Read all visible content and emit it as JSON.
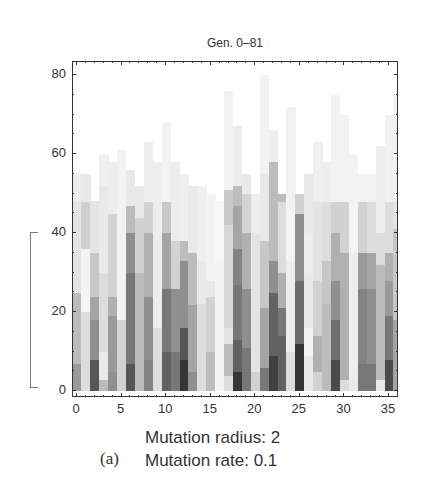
{
  "chart_data": {
    "type": "heatmap",
    "title": "Gen. 0–81",
    "xlabel": "",
    "ylabel": "",
    "xlim": [
      0,
      36
    ],
    "ylim": [
      0,
      82
    ],
    "x_ticks": [
      0,
      5,
      10,
      15,
      20,
      25,
      30,
      35
    ],
    "y_ticks": [
      0,
      20,
      40,
      60,
      80
    ],
    "grid": false,
    "legend": null,
    "columns": [
      {
        "x": 0,
        "segments": [
          [
            0,
            7,
            0.45
          ],
          [
            7,
            25,
            0.3
          ],
          [
            25,
            48,
            0.12
          ],
          [
            48,
            55,
            0.08
          ]
        ]
      },
      {
        "x": 1,
        "segments": [
          [
            0,
            20,
            0.15
          ],
          [
            20,
            36,
            0.05
          ],
          [
            36,
            48,
            0.22
          ],
          [
            48,
            55,
            0.1
          ]
        ]
      },
      {
        "x": 2,
        "segments": [
          [
            0,
            8,
            0.75
          ],
          [
            8,
            18,
            0.5
          ],
          [
            18,
            24,
            0.4
          ],
          [
            24,
            35,
            0.25
          ],
          [
            35,
            48,
            0.12
          ]
        ]
      },
      {
        "x": 3,
        "segments": [
          [
            0,
            3,
            0.3
          ],
          [
            3,
            10,
            0.1
          ],
          [
            10,
            30,
            0.15
          ],
          [
            30,
            52,
            0.1
          ],
          [
            52,
            60,
            0.07
          ]
        ]
      },
      {
        "x": 4,
        "segments": [
          [
            0,
            5,
            0.5
          ],
          [
            5,
            19,
            0.45
          ],
          [
            19,
            24,
            0.35
          ],
          [
            24,
            45,
            0.2
          ],
          [
            45,
            58,
            0.08
          ]
        ]
      },
      {
        "x": 5,
        "segments": [
          [
            0,
            18,
            0.2
          ],
          [
            18,
            50,
            0.06
          ],
          [
            50,
            61,
            0.06
          ]
        ]
      },
      {
        "x": 6,
        "segments": [
          [
            0,
            7,
            0.75
          ],
          [
            7,
            30,
            0.6
          ],
          [
            30,
            40,
            0.5
          ],
          [
            40,
            47,
            0.3
          ],
          [
            47,
            56,
            0.1
          ]
        ]
      },
      {
        "x": 7,
        "segments": [
          [
            0,
            30,
            0.3
          ],
          [
            30,
            44,
            0.2
          ],
          [
            44,
            52,
            0.1
          ]
        ]
      },
      {
        "x": 8,
        "segments": [
          [
            0,
            8,
            0.55
          ],
          [
            8,
            24,
            0.5
          ],
          [
            24,
            40,
            0.35
          ],
          [
            40,
            48,
            0.2
          ],
          [
            48,
            63,
            0.07
          ]
        ]
      },
      {
        "x": 9,
        "segments": [
          [
            0,
            16,
            0.15
          ],
          [
            16,
            48,
            0.08
          ],
          [
            48,
            58,
            0.07
          ]
        ]
      },
      {
        "x": 10,
        "segments": [
          [
            0,
            10,
            0.7
          ],
          [
            10,
            26,
            0.6
          ],
          [
            26,
            40,
            0.4
          ],
          [
            40,
            48,
            0.25
          ],
          [
            48,
            68,
            0.06
          ]
        ]
      },
      {
        "x": 11,
        "segments": [
          [
            0,
            10,
            0.6
          ],
          [
            10,
            26,
            0.5
          ],
          [
            26,
            38,
            0.2
          ],
          [
            38,
            58,
            0.08
          ]
        ]
      },
      {
        "x": 12,
        "segments": [
          [
            0,
            8,
            0.9
          ],
          [
            8,
            16,
            0.75
          ],
          [
            16,
            33,
            0.5
          ],
          [
            33,
            38,
            0.3
          ],
          [
            38,
            55,
            0.07
          ]
        ]
      },
      {
        "x": 13,
        "segments": [
          [
            0,
            5,
            0.5
          ],
          [
            5,
            22,
            0.4
          ],
          [
            22,
            35,
            0.3
          ],
          [
            35,
            52,
            0.1
          ]
        ]
      },
      {
        "x": 14,
        "segments": [
          [
            0,
            22,
            0.15
          ],
          [
            22,
            33,
            0.1
          ],
          [
            33,
            52,
            0.07
          ]
        ]
      },
      {
        "x": 15,
        "segments": [
          [
            0,
            10,
            0.3
          ],
          [
            10,
            24,
            0.2
          ],
          [
            24,
            28,
            0.1
          ],
          [
            28,
            50,
            0.06
          ]
        ]
      },
      {
        "x": 16,
        "segments": [
          [
            0,
            33,
            0.05
          ],
          [
            33,
            48,
            0.04
          ]
        ]
      },
      {
        "x": 17,
        "segments": [
          [
            0,
            4,
            0.15
          ],
          [
            4,
            12,
            0.3
          ],
          [
            12,
            16,
            0.12
          ],
          [
            16,
            42,
            0.18
          ],
          [
            42,
            51,
            0.25
          ],
          [
            51,
            76,
            0.06
          ]
        ]
      },
      {
        "x": 18,
        "segments": [
          [
            0,
            5,
            0.9
          ],
          [
            5,
            13,
            0.7
          ],
          [
            13,
            27,
            0.6
          ],
          [
            27,
            36,
            0.55
          ],
          [
            36,
            47,
            0.4
          ],
          [
            47,
            52,
            0.3
          ],
          [
            52,
            67,
            0.08
          ]
        ]
      },
      {
        "x": 19,
        "segments": [
          [
            0,
            11,
            0.6
          ],
          [
            11,
            26,
            0.5
          ],
          [
            26,
            40,
            0.35
          ],
          [
            40,
            50,
            0.2
          ],
          [
            50,
            55,
            0.1
          ]
        ]
      },
      {
        "x": 20,
        "segments": [
          [
            0,
            5,
            0.2
          ],
          [
            5,
            40,
            0.12
          ],
          [
            40,
            50,
            0.08
          ]
        ]
      },
      {
        "x": 21,
        "segments": [
          [
            0,
            6,
            0.6
          ],
          [
            6,
            21,
            0.4
          ],
          [
            21,
            38,
            0.25
          ],
          [
            38,
            55,
            0.1
          ],
          [
            55,
            80,
            0.06
          ]
        ]
      },
      {
        "x": 22,
        "segments": [
          [
            0,
            9,
            0.85
          ],
          [
            9,
            25,
            0.7
          ],
          [
            25,
            33,
            0.5
          ],
          [
            33,
            47,
            0.3
          ],
          [
            47,
            58,
            0.3
          ],
          [
            58,
            66,
            0.08
          ]
        ]
      },
      {
        "x": 23,
        "segments": [
          [
            0,
            14,
            0.7
          ],
          [
            14,
            21,
            0.6
          ],
          [
            21,
            30,
            0.35
          ],
          [
            30,
            48,
            0.15
          ],
          [
            48,
            50,
            0.3
          ]
        ]
      },
      {
        "x": 24,
        "segments": [
          [
            0,
            10,
            0.15
          ],
          [
            10,
            33,
            0.08
          ],
          [
            33,
            48,
            0.05
          ],
          [
            48,
            72,
            0.06
          ]
        ]
      },
      {
        "x": 25,
        "segments": [
          [
            0,
            12,
            0.9
          ],
          [
            12,
            28,
            0.65
          ],
          [
            28,
            45,
            0.5
          ],
          [
            45,
            50,
            0.2
          ]
        ]
      },
      {
        "x": 26,
        "segments": [
          [
            0,
            9,
            0.1
          ],
          [
            9,
            16,
            0.05
          ],
          [
            16,
            30,
            0.1
          ],
          [
            30,
            40,
            0.08
          ],
          [
            40,
            55,
            0.1
          ]
        ]
      },
      {
        "x": 27,
        "segments": [
          [
            0,
            5,
            0.2
          ],
          [
            5,
            14,
            0.35
          ],
          [
            14,
            28,
            0.2
          ],
          [
            28,
            48,
            0.12
          ],
          [
            48,
            63,
            0.07
          ]
        ]
      },
      {
        "x": 28,
        "segments": [
          [
            0,
            22,
            0.3
          ],
          [
            22,
            33,
            0.25
          ],
          [
            33,
            48,
            0.15
          ],
          [
            48,
            58,
            0.08
          ]
        ]
      },
      {
        "x": 29,
        "segments": [
          [
            0,
            8,
            0.8
          ],
          [
            8,
            18,
            0.65
          ],
          [
            18,
            28,
            0.5
          ],
          [
            28,
            40,
            0.35
          ],
          [
            40,
            48,
            0.2
          ],
          [
            48,
            75,
            0.06
          ]
        ]
      },
      {
        "x": 30,
        "segments": [
          [
            0,
            3,
            0.15
          ],
          [
            3,
            35,
            0.35
          ],
          [
            35,
            48,
            0.2
          ],
          [
            48,
            70,
            0.06
          ]
        ]
      },
      {
        "x": 31,
        "segments": [
          [
            0,
            3,
            0.1
          ],
          [
            3,
            35,
            0.08
          ],
          [
            35,
            48,
            0.05
          ],
          [
            48,
            60,
            0.06
          ]
        ]
      },
      {
        "x": 32,
        "segments": [
          [
            0,
            7,
            0.6
          ],
          [
            7,
            26,
            0.55
          ],
          [
            26,
            35,
            0.45
          ],
          [
            35,
            48,
            0.2
          ],
          [
            48,
            55,
            0.06
          ]
        ]
      },
      {
        "x": 33,
        "segments": [
          [
            0,
            7,
            0.6
          ],
          [
            7,
            26,
            0.5
          ],
          [
            26,
            35,
            0.4
          ],
          [
            35,
            48,
            0.15
          ],
          [
            48,
            55,
            0.06
          ]
        ]
      },
      {
        "x": 34,
        "segments": [
          [
            0,
            3,
            0.1
          ],
          [
            3,
            32,
            0.3
          ],
          [
            32,
            40,
            0.15
          ],
          [
            40,
            62,
            0.07
          ]
        ]
      },
      {
        "x": 35,
        "segments": [
          [
            0,
            8,
            0.8
          ],
          [
            8,
            19,
            0.6
          ],
          [
            19,
            28,
            0.45
          ],
          [
            28,
            35,
            0.35
          ],
          [
            35,
            48,
            0.15
          ],
          [
            48,
            70,
            0.06
          ]
        ]
      },
      {
        "x": 36,
        "segments": [
          [
            0,
            18,
            0.4
          ],
          [
            18,
            41,
            0.25
          ],
          [
            41,
            48,
            0.12
          ],
          [
            48,
            75,
            0.06
          ]
        ]
      }
    ],
    "annotations": [
      "bracket spanning y = 0 to 40 on left of axis"
    ]
  },
  "caption": {
    "label": "(a)",
    "line1": "Mutation radius: 2",
    "line2": "Mutation rate: 0.1"
  }
}
